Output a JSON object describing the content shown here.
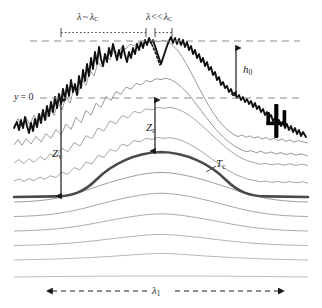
{
  "figure": {
    "name": "landscape-relief-schematic",
    "background_color": "#ffffff"
  },
  "colors": {
    "surface_top": "#111111",
    "tc_curve": "#4a4a4a",
    "gray_curve": "#9a9a9a",
    "gray_curve_faint": "#b8b8b8",
    "datum_dash": "#8c8c8c",
    "annotation": "#1f1f1f",
    "cactus": "#050505"
  },
  "labels": {
    "lambda_near_lc": {
      "text": "λ ~ λC",
      "lambda": "λ",
      "relation": "~",
      "lambda_c_base": "λ",
      "lambda_c_sub": "C"
    },
    "lambda_much_less_lc": {
      "text": "λ << λC",
      "lambda": "λ",
      "relation": "<<",
      "lambda_c_base": "λ",
      "lambda_c_sub": "C"
    },
    "datum": {
      "text": "y = 0",
      "variable": "y",
      "equals": "= 0"
    },
    "z_v": {
      "text": "Zv",
      "base": "Z",
      "sub": "v"
    },
    "z_r": {
      "text": "Zr",
      "base": "Z",
      "sub": "r"
    },
    "h_0": {
      "text": "h0",
      "base": "h",
      "sub": "0"
    },
    "t_c": {
      "text": "Tc",
      "base": "T",
      "sub": "c"
    },
    "lambda_1": {
      "text": "λ1",
      "base": "λ",
      "sub": "1"
    }
  },
  "annotations": {
    "top_scale_bar_long": {
      "name": "wavelength-near-critical-bar",
      "style": "dotted-with-end-ticks",
      "x_start": 61,
      "x_end": 146
    },
    "top_scale_bar_short": {
      "name": "wavelength-much-less-critical-bar",
      "style": "dotted-with-end-ticks",
      "x_start": 155,
      "x_end": 172
    },
    "datum_line": {
      "name": "y-zero-datum-line",
      "style": "dashed",
      "y": 98
    },
    "upper_dashed_line": {
      "name": "crest-envelope-dashed-line",
      "style": "dashed",
      "y": 41
    },
    "h0_arrow": {
      "name": "h0-double-arrow",
      "x": 236,
      "y_top": 47,
      "y_bottom": 95
    },
    "zv_arrow": {
      "name": "zv-double-arrow",
      "x": 61,
      "y_top": 99,
      "y_bottom": 198
    },
    "zr_arrow": {
      "name": "zr-double-arrow",
      "x": 155,
      "y_top": 99,
      "y_bottom": 152
    },
    "lambda1_arrow": {
      "name": "lambda1-double-arrow",
      "style": "dashed",
      "x_start": 48,
      "x_end": 283,
      "y": 291
    }
  },
  "curves": [
    {
      "name": "rough-topographic-surface",
      "role": "top-jagged-surface",
      "weight": "thick",
      "color": "#111111",
      "rough": true
    },
    {
      "name": "smoothed-surface-1",
      "role": "subsurface-layer",
      "weight": "thin",
      "color": "#9a9a9a",
      "rough": true
    },
    {
      "name": "smoothed-surface-2",
      "role": "subsurface-layer",
      "weight": "thin",
      "color": "#9a9a9a",
      "rough": true
    },
    {
      "name": "smoothed-surface-3",
      "role": "subsurface-layer",
      "weight": "thin",
      "color": "#a5a5a5",
      "rough": true
    },
    {
      "name": "smoothed-surface-4",
      "role": "subsurface-layer",
      "weight": "thin",
      "color": "#a8a8a8",
      "rough": true
    },
    {
      "name": "critical-surface-tc",
      "role": "tc-reference-curve",
      "weight": "thick",
      "color": "#4a4a4a",
      "rough": false
    },
    {
      "name": "deep-layer-1",
      "role": "deep-layer",
      "weight": "thin",
      "color": "#9e9e9e",
      "rough": false
    },
    {
      "name": "deep-layer-2",
      "role": "deep-layer",
      "weight": "thin",
      "color": "#a6a6a6",
      "rough": false
    },
    {
      "name": "deep-layer-3",
      "role": "deep-layer",
      "weight": "thin",
      "color": "#acacac",
      "rough": false
    },
    {
      "name": "deep-layer-4",
      "role": "deep-layer",
      "weight": "thin",
      "color": "#b2b2b2",
      "rough": false
    },
    {
      "name": "deep-layer-5",
      "role": "deep-layer",
      "weight": "thin",
      "color": "#b8b8b8",
      "rough": false
    },
    {
      "name": "basal-layer",
      "role": "flat-base-line",
      "weight": "thin",
      "color": "#bcbcbc",
      "rough": false
    }
  ],
  "decorations": {
    "cactus": {
      "name": "saguaro-cactus-icon",
      "x": 276,
      "y": 118,
      "arms": 2
    },
    "dashed_flank_segment": {
      "name": "dashed-crest-flank-segment",
      "description": "short dashed segment on descending flank of main crest"
    }
  }
}
